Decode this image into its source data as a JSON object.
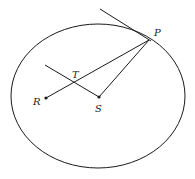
{
  "diagram": {
    "type": "ellipse-geometry",
    "ellipse": {
      "cx": 98,
      "cy": 96,
      "rx": 87,
      "ry": 72
    },
    "points": [
      {
        "id": "P",
        "label": "P",
        "x": 149,
        "y": 40,
        "label_x": 154,
        "label_y": 36
      },
      {
        "id": "R",
        "label": "R",
        "x": 46,
        "y": 98,
        "label_x": 33,
        "label_y": 105
      },
      {
        "id": "S",
        "label": "S",
        "x": 99,
        "y": 97,
        "label_x": 95,
        "label_y": 112
      },
      {
        "id": "T",
        "label": "T",
        "x": 75,
        "y": 82,
        "label_x": 72,
        "label_y": 78
      }
    ],
    "segments": [
      {
        "name": "tangent-line",
        "x1": 100,
        "y1": 9,
        "x2": 151,
        "y2": 41
      },
      {
        "name": "segment-RP",
        "x1": 46,
        "y1": 98,
        "x2": 149,
        "y2": 40
      },
      {
        "name": "segment-SP",
        "x1": 99,
        "y1": 97,
        "x2": 149,
        "y2": 40
      },
      {
        "name": "segment-TS",
        "x1": 45,
        "y1": 65,
        "x2": 99,
        "y2": 97
      }
    ],
    "color": "#1a1a1a"
  }
}
